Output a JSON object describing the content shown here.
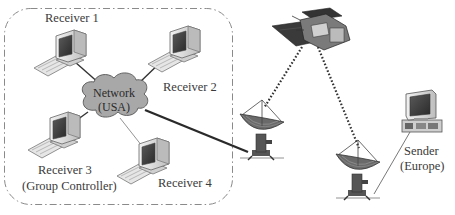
{
  "diagram": {
    "type": "network-satellite-multicast",
    "group_box": {
      "style": "dash-dot rounded rectangle",
      "color": "#8a8a8a"
    },
    "network": {
      "label_line1": "Network",
      "label_line2": "(USA)",
      "fill": "#a8a8a8"
    },
    "receivers": [
      {
        "id": "receiver-1",
        "label": "Receiver 1",
        "sublabel": ""
      },
      {
        "id": "receiver-2",
        "label": "Receiver 2",
        "sublabel": ""
      },
      {
        "id": "receiver-3",
        "label": "Receiver 3",
        "sublabel": "(Group Controller)"
      },
      {
        "id": "receiver-4",
        "label": "Receiver 4",
        "sublabel": ""
      }
    ],
    "sender": {
      "label": "Sender",
      "sublabel": "(Europe)"
    },
    "satellite": {
      "label": ""
    },
    "ground_stations": [
      {
        "id": "dish-usa",
        "label": ""
      },
      {
        "id": "dish-europe",
        "label": ""
      }
    ],
    "links": [
      {
        "from": "receiver-1",
        "to": "network",
        "style": "solid"
      },
      {
        "from": "receiver-2",
        "to": "network",
        "style": "solid"
      },
      {
        "from": "receiver-3",
        "to": "network",
        "style": "solid"
      },
      {
        "from": "receiver-4",
        "to": "network",
        "style": "thin"
      },
      {
        "from": "network",
        "to": "dish-usa",
        "style": "solid-thick"
      },
      {
        "from": "dish-usa",
        "to": "satellite",
        "style": "dotted"
      },
      {
        "from": "satellite",
        "to": "dish-europe",
        "style": "dotted"
      },
      {
        "from": "dish-europe",
        "to": "sender",
        "style": "thin"
      }
    ]
  }
}
